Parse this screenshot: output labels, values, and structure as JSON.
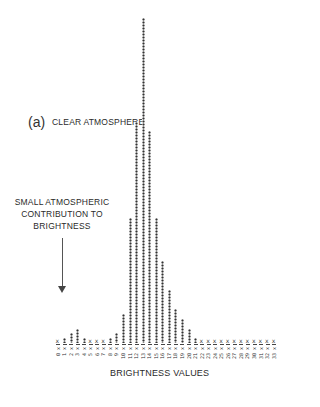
{
  "panel_label": "(a)",
  "annotations": {
    "clear": "CLEAR ATMOSPHERE",
    "small_line1": "SMALL ATMOSPHERIC",
    "small_line2": "CONTRIBUTION TO",
    "small_line3": "BRIGHTNESS"
  },
  "chart_data": {
    "type": "bar",
    "title": "",
    "xlabel": "BRIGHTNESS VALUES",
    "ylabel": "",
    "categories": [
      "0",
      "1",
      "2",
      "3",
      "4",
      "5",
      "6",
      "7",
      "8",
      "9",
      "10",
      "11",
      "12",
      "13",
      "14",
      "15",
      "16",
      "17",
      "18",
      "19",
      "20",
      "21",
      "22",
      "23",
      "24",
      "25",
      "26",
      "27",
      "28",
      "29",
      "30",
      "31",
      "32",
      "33"
    ],
    "values": [
      1,
      2,
      4,
      6,
      2,
      1,
      1,
      1,
      2,
      4,
      12,
      52,
      92,
      135,
      88,
      52,
      34,
      22,
      14,
      10,
      6,
      2,
      1,
      1,
      1,
      1,
      1,
      1,
      1,
      1,
      1,
      1,
      1,
      1
    ],
    "annotations": [
      "CLEAR ATMOSPHERE",
      "SMALL ATMOSPHERIC CONTRIBUTION TO BRIGHTNESS"
    ],
    "grid": false,
    "legend": null,
    "ylim": [
      0,
      135
    ]
  }
}
